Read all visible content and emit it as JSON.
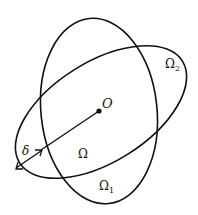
{
  "diagram": {
    "labels": {
      "center": "O",
      "omega": "Ω",
      "omega1": "Ω",
      "omega1_sub": "1",
      "omega2": "Ω",
      "omega2_sub": "2",
      "delta": "δ"
    },
    "colors": {
      "stroke": "#111111",
      "background": "#ffffff"
    }
  }
}
